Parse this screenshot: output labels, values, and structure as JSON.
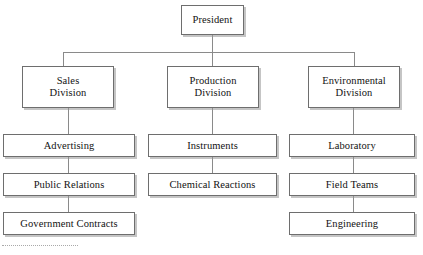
{
  "diagram": {
    "type": "org-chart",
    "background_color": "#ffffff",
    "box_border_color": "#6e6e6e",
    "box_fill_color": "#ffffff",
    "connector_color": "#8a8a8a",
    "shadow_color": "#969696"
  },
  "nodes": {
    "president": {
      "label": "President"
    },
    "sales_division": {
      "label": "Sales\nDivision"
    },
    "production_division": {
      "label": "Production\nDivision"
    },
    "environmental_division": {
      "label": "Environmental\nDivision"
    },
    "advertising": {
      "label": "Advertising"
    },
    "public_relations": {
      "label": "Public Relations"
    },
    "government_contracts": {
      "label": "Government Contracts"
    },
    "instruments": {
      "label": "Instruments"
    },
    "chemical_reactions": {
      "label": "Chemical Reactions"
    },
    "laboratory": {
      "label": "Laboratory"
    },
    "field_teams": {
      "label": "Field Teams"
    },
    "engineering": {
      "label": "Engineering"
    }
  },
  "hierarchy": {
    "root": "president",
    "level2": [
      "sales_division",
      "production_division",
      "environmental_division"
    ],
    "sales_children": [
      "advertising",
      "public_relations",
      "government_contracts"
    ],
    "production_children": [
      "instruments",
      "chemical_reactions"
    ],
    "environmental_children": [
      "laboratory",
      "field_teams",
      "engineering"
    ]
  }
}
